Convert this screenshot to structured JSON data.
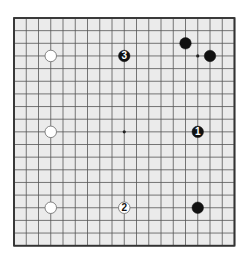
{
  "board": {
    "size": 19,
    "origin_x": 14,
    "origin_y": 18,
    "spacing_x": 12.25,
    "spacing_y": 12.65,
    "background": "#ebebeb",
    "line_color": "#555555",
    "border_color": "#333333",
    "hoshi": [
      [
        3,
        3
      ],
      [
        9,
        3
      ],
      [
        15,
        3
      ],
      [
        3,
        9
      ],
      [
        9,
        9
      ],
      [
        15,
        9
      ],
      [
        3,
        15
      ],
      [
        9,
        15
      ],
      [
        15,
        15
      ]
    ],
    "visible_hoshi": [
      [
        15,
        3
      ],
      [
        9,
        9
      ]
    ]
  },
  "stones": [
    {
      "color": "white",
      "col": 3,
      "row": 3,
      "label": ""
    },
    {
      "color": "white",
      "col": 3,
      "row": 9,
      "label": ""
    },
    {
      "color": "white",
      "col": 3,
      "row": 15,
      "label": ""
    },
    {
      "color": "black",
      "col": 14,
      "row": 2,
      "label": ""
    },
    {
      "color": "black",
      "col": 16,
      "row": 3,
      "label": ""
    },
    {
      "color": "black",
      "col": 15,
      "row": 15,
      "label": ""
    },
    {
      "color": "black",
      "col": 9,
      "row": 3,
      "label": "3"
    },
    {
      "color": "black",
      "col": 15,
      "row": 9,
      "label": "1"
    },
    {
      "color": "white",
      "col": 9,
      "row": 15,
      "label": "2"
    }
  ],
  "colors": {
    "black_stone": "#111111",
    "white_stone": "#ffffff",
    "white_stone_edge": "#777777"
  }
}
